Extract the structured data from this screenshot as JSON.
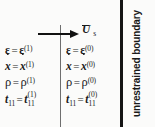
{
  "figure": {
    "type": "interface-jump-conditions-diagram",
    "background_color": "#fbfbfa",
    "ink_color": "#1a1a1a"
  },
  "interface": {
    "divider_name": "shock-interface-line",
    "boundary_line_color": "#141414"
  },
  "velocity": {
    "label_symbol": "U",
    "label_subscript": "s",
    "arrow_direction": "right"
  },
  "inner_region": {
    "superscript": "(1)",
    "lines": [
      {
        "lhs": "ε",
        "eq": "=",
        "rhs": "ε",
        "sup": "(1)",
        "style": "greek-bold"
      },
      {
        "lhs": "x",
        "eq": "=",
        "rhs": "x",
        "sup": "(1)",
        "style": "dotted-vector"
      },
      {
        "lhs": "ρ",
        "eq": "=",
        "rhs": "ρ",
        "sup": "(1)",
        "style": "greek-upright"
      },
      {
        "lhs": "t",
        "eq": "=",
        "rhs": "t",
        "sup": "(1)",
        "sub": "11",
        "style": "tensor"
      }
    ]
  },
  "outer_region": {
    "superscript": "(0)",
    "lines": [
      {
        "lhs": "ε",
        "eq": "=",
        "rhs": "ε",
        "sup": "(0)",
        "style": "greek-bold"
      },
      {
        "lhs": "x",
        "eq": "=",
        "rhs": "x",
        "sup": "(0)",
        "style": "dotted-vector"
      },
      {
        "lhs": "ρ",
        "eq": "=",
        "rhs": "ρ",
        "sup": "(0)",
        "style": "greek-upright"
      },
      {
        "lhs": "t",
        "eq": "=",
        "rhs": "t",
        "sup": "(0)",
        "sub": "11",
        "style": "tensor"
      }
    ]
  },
  "boundary": {
    "caption": "unrestrained boundary"
  }
}
